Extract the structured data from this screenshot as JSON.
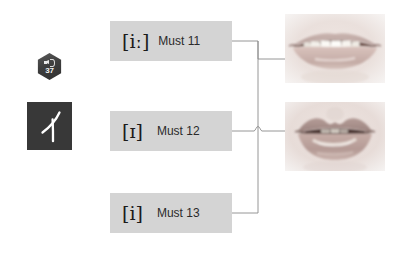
{
  "page": {
    "background_color": "#ffffff"
  },
  "audio_badge": {
    "name": "audio-track-badge",
    "icon": "speaker-icon",
    "track_number": "37",
    "shape": "hexagon",
    "fill_color": "#3e3e3e",
    "text_color": "#f2f2f2"
  },
  "kana_tile": {
    "name": "katakana-tile",
    "character": "イ",
    "romaji_hint": "i",
    "fill_color": "#383838",
    "text_color": "#ffffff"
  },
  "rows": [
    {
      "id": "row-must-11",
      "ipa": "[iː]",
      "label": "Must 11",
      "box_color": "#d4d4d4",
      "connects_to": "mouth-spread"
    },
    {
      "id": "row-must-12",
      "ipa": "[ɪ]",
      "label": "Must 12",
      "box_color": "#d4d4d4",
      "connects_to": "mouth-relaxed"
    },
    {
      "id": "row-must-13",
      "ipa": "[i]",
      "label": "Must 13",
      "box_color": "#d4d4d4",
      "connects_to": "mouth-relaxed"
    }
  ],
  "mouth_images": [
    {
      "id": "mouth-spread",
      "name": "mouth-photo-spread",
      "description": "Lips spread wide, upper and lower teeth visible",
      "position": "top"
    },
    {
      "id": "mouth-relaxed",
      "name": "mouth-photo-relaxed",
      "description": "Lips slightly parted and relaxed, lower teeth visible",
      "position": "bottom"
    }
  ],
  "connectors": {
    "name": "connector-lines",
    "stroke_color": "#8b8b8b",
    "has_line_hop": true
  }
}
